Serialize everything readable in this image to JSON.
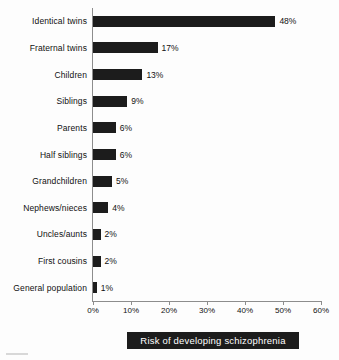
{
  "chart_data": {
    "type": "bar",
    "orientation": "horizontal",
    "title": "Risk of developing schizophrenia",
    "xlabel": "Risk of developing schizophrenia",
    "ylabel": "",
    "xlim": [
      0,
      60
    ],
    "xticks": [
      0,
      10,
      20,
      30,
      40,
      50,
      60
    ],
    "xtick_labels": [
      "0%",
      "10%",
      "20%",
      "30%",
      "40%",
      "50%",
      "60%"
    ],
    "grid": false,
    "legend": false,
    "bar_color": "#1c1c1c",
    "background_color": "#fdfdfd",
    "axis_color": "#8d8d8d",
    "categories": [
      "Identical twins",
      "Fraternal twins",
      "Children",
      "Siblings",
      "Parents",
      "Half siblings",
      "Grandchildren",
      "Nephews/nieces",
      "Uncles/aunts",
      "First cousins",
      "General population"
    ],
    "values": [
      48,
      17,
      13,
      9,
      6,
      6,
      5,
      4,
      2,
      2,
      1
    ],
    "value_labels": [
      "48%",
      "17%",
      "13%",
      "9%",
      "6%",
      "6%",
      "5%",
      "4%",
      "2%",
      "2%",
      "1%"
    ]
  }
}
